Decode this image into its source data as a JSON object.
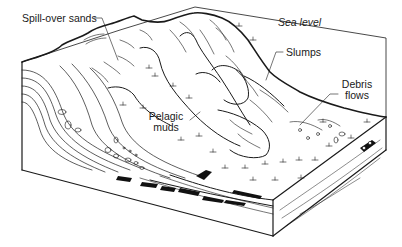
{
  "figure": {
    "type": "block diagram",
    "colors": {
      "line": "#1a1a1a",
      "background": "#ffffff",
      "fill_dark": "#111111"
    }
  },
  "labels": {
    "spill_over_sands": "Spill-over sands",
    "sea_level": "Sea level",
    "slumps": "Slumps",
    "debris_flows_line1": "Debris",
    "debris_flows_line2": "flows",
    "pelagic_muds_line1": "Pelagic",
    "pelagic_muds_line2": "muds"
  }
}
